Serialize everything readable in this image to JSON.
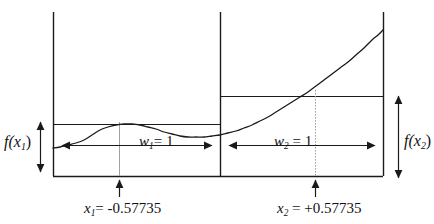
{
  "figure": {
    "background_color": "#ffffff",
    "line_color": "#1a1a1a",
    "guide_color": "#9a9a9a",
    "width": 434,
    "height": 224
  },
  "labels": {
    "f_x1": "f(x",
    "f_x1_sub": "1",
    "f_x1_tail": ")",
    "f_x2": "f(x",
    "f_x2_sub": "2",
    "f_x2_tail": ")",
    "w1": "w",
    "w1_sub": "1",
    "w1_tail": "= 1",
    "w2": "w",
    "w2_sub": "2",
    "w2_tail": " = 1",
    "x1": "x",
    "x1_sub": "1",
    "x1_tail": "= -0.57735",
    "x2": "x",
    "x2_sub": "2",
    "x2_tail": " = +0.57735"
  },
  "chart_data": {
    "type": "line",
    "xlabel": "",
    "ylabel": "",
    "grid": false,
    "legend": "none",
    "xlim": [
      -1.73205,
      1.73205
    ],
    "ylim": [
      0,
      1
    ],
    "annotations": [
      {
        "name": "x1",
        "text": "x₁= -0.57735",
        "value": -0.57735
      },
      {
        "name": "x2",
        "text": "x₂ = +0.57735",
        "value": 0.57735
      },
      {
        "name": "w1",
        "text": "w₁= 1",
        "value": 1
      },
      {
        "name": "w2",
        "text": "w₂ = 1",
        "value": 1
      },
      {
        "name": "f_x1",
        "text": "f(x₁)",
        "value": 0.302
      },
      {
        "name": "f_x2",
        "text": "f(x₂)",
        "value": 0.488
      }
    ],
    "series": [
      {
        "name": "f(x)",
        "comment": "integrand curve sampled left-to-right in pixel space",
        "points_px": [
          [
            53,
            148
          ],
          [
            60,
            147
          ],
          [
            68,
            145
          ],
          [
            76,
            143
          ],
          [
            84,
            140
          ],
          [
            92,
            135
          ],
          [
            100,
            130
          ],
          [
            108,
            127
          ],
          [
            116,
            125
          ],
          [
            124,
            124
          ],
          [
            132,
            124
          ],
          [
            140,
            125
          ],
          [
            148,
            127
          ],
          [
            156,
            129
          ],
          [
            164,
            132
          ],
          [
            172,
            134
          ],
          [
            180,
            136
          ],
          [
            188,
            137
          ],
          [
            196,
            137
          ],
          [
            204,
            137
          ],
          [
            212,
            136
          ],
          [
            220,
            135
          ],
          [
            228,
            133
          ],
          [
            236,
            131
          ],
          [
            244,
            128
          ],
          [
            252,
            125
          ],
          [
            260,
            121
          ],
          [
            268,
            117
          ],
          [
            276,
            112
          ],
          [
            284,
            107
          ],
          [
            292,
            102
          ],
          [
            300,
            97
          ],
          [
            308,
            92
          ],
          [
            316,
            86
          ],
          [
            324,
            80
          ],
          [
            332,
            74
          ],
          [
            340,
            68
          ],
          [
            348,
            62
          ],
          [
            356,
            55
          ],
          [
            364,
            48
          ],
          [
            372,
            40
          ],
          [
            378,
            35
          ],
          [
            383,
            30
          ]
        ]
      }
    ],
    "bars_px": [
      {
        "name": "rectangle-left",
        "x_left": 53,
        "x_right": 220,
        "y_top": 125,
        "y_bottom": 176
      },
      {
        "name": "rectangle-right",
        "x_left": 220,
        "x_right": 383,
        "y_top": 97,
        "y_bottom": 176
      }
    ]
  }
}
